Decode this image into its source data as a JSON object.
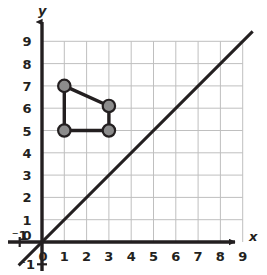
{
  "figure": {
    "title": "",
    "x_axis_label": "x",
    "y_axis_label": "y",
    "x_tick_labels": [
      "⁻1",
      "0",
      "1",
      "2",
      "3",
      "4",
      "5",
      "6",
      "7",
      "8",
      "9"
    ],
    "y_tick_labels": [
      "9",
      "8",
      "7",
      "6",
      "5",
      "4",
      "3",
      "2",
      "1",
      "0",
      "⁻1"
    ],
    "origin_label": "0",
    "colors": {
      "grid": "#bfbfbf",
      "axis": "#231f20",
      "line": "#231f20",
      "vertex_fill": "#8c8c8c",
      "vertex_stroke": "#231f20",
      "background": "#ffffff",
      "text": "#231f20"
    }
  },
  "chart_data": {
    "type": "scatter",
    "title": "",
    "xlabel": "x",
    "ylabel": "y",
    "xlim": [
      -1,
      9.5
    ],
    "ylim": [
      -1,
      9.5
    ],
    "grid": true,
    "grid_range": {
      "x": [
        1,
        9
      ],
      "y": [
        1,
        9
      ]
    },
    "x_ticks": [
      -1,
      0,
      1,
      2,
      3,
      4,
      5,
      6,
      7,
      8,
      9
    ],
    "y_ticks": [
      -1,
      0,
      1,
      2,
      3,
      4,
      5,
      6,
      7,
      8,
      9
    ],
    "legend": null,
    "series": [
      {
        "name": "line of reflection y = x",
        "type": "line",
        "equation": "y = x",
        "points": [
          [
            -1,
            -1
          ],
          [
            9.4,
            9.4
          ]
        ],
        "style": "solid",
        "color": "#231f20",
        "width": 3
      },
      {
        "name": "quadrilateral",
        "type": "polygon",
        "closed": true,
        "vertices": [
          {
            "x": 1,
            "y": 7,
            "label": ""
          },
          {
            "x": 3,
            "y": 6.1,
            "label": ""
          },
          {
            "x": 3,
            "y": 5,
            "label": ""
          },
          {
            "x": 1,
            "y": 5,
            "label": ""
          }
        ],
        "marker": "filled-circle",
        "marker_fill": "#8c8c8c",
        "marker_stroke": "#231f20",
        "edge_color": "#231f20",
        "edge_width": 3.4
      }
    ]
  }
}
